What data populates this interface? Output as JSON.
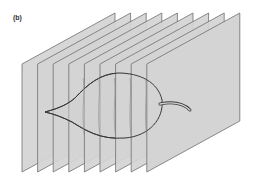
{
  "figure": {
    "panel_label": "(b)",
    "plane_count": 9,
    "colors": {
      "plane_fill": "#d4d4d4",
      "plane_stroke": "#6e6e6e",
      "leaf_stroke": "#3a3a3a",
      "leaf_fill": "#cfcfcf",
      "background": "#ffffff"
    }
  }
}
